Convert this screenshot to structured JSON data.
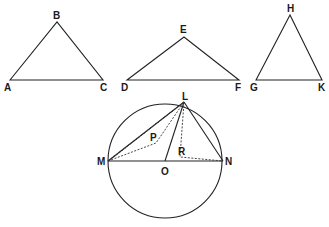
{
  "diagram": {
    "triangles": [
      {
        "name": "ABC",
        "vertices": {
          "A": [
            10,
            80
          ],
          "B": [
            57,
            22
          ],
          "C": [
            103,
            80
          ]
        },
        "labels": [
          {
            "text": "A",
            "x": 4,
            "y": 91
          },
          {
            "text": "B",
            "x": 53,
            "y": 19
          },
          {
            "text": "C",
            "x": 100,
            "y": 91
          }
        ]
      },
      {
        "name": "DEF",
        "vertices": {
          "D": [
            127,
            80
          ],
          "E": [
            184,
            37
          ],
          "F": [
            239,
            80
          ]
        },
        "labels": [
          {
            "text": "D",
            "x": 121,
            "y": 91
          },
          {
            "text": "E",
            "x": 180,
            "y": 33
          },
          {
            "text": "F",
            "x": 235,
            "y": 91
          }
        ]
      },
      {
        "name": "GHK",
        "vertices": {
          "G": [
            256,
            80
          ],
          "H": [
            290,
            15
          ],
          "K": [
            322,
            80
          ]
        },
        "labels": [
          {
            "text": "G",
            "x": 250,
            "y": 91
          },
          {
            "text": "H",
            "x": 287,
            "y": 12
          },
          {
            "text": "K",
            "x": 318,
            "y": 91
          }
        ]
      }
    ],
    "circle": {
      "center": [
        165,
        161
      ],
      "radius": 57,
      "points": {
        "L": [
          184,
          102
        ],
        "M": [
          108,
          161
        ],
        "N": [
          223,
          161
        ],
        "O": [
          165,
          161
        ],
        "P": [
          156,
          143
        ],
        "R": [
          182,
          157
        ]
      },
      "labels": [
        {
          "text": "L",
          "x": 182,
          "y": 100
        },
        {
          "text": "M",
          "x": 97,
          "y": 165
        },
        {
          "text": "N",
          "x": 225,
          "y": 165
        },
        {
          "text": "O",
          "x": 161,
          "y": 175
        },
        {
          "text": "P",
          "x": 150,
          "y": 141
        },
        {
          "text": "R",
          "x": 178,
          "y": 155
        }
      ],
      "solid_segments": [
        [
          "M",
          "N"
        ],
        [
          "M",
          "L"
        ],
        [
          "L",
          "N"
        ],
        [
          "O",
          "L"
        ]
      ],
      "dashed_segments": [
        [
          "M",
          "P"
        ],
        [
          "P",
          "L"
        ],
        [
          "L",
          "R"
        ],
        [
          "R",
          "N"
        ],
        [
          "M",
          "L2"
        ]
      ]
    }
  }
}
